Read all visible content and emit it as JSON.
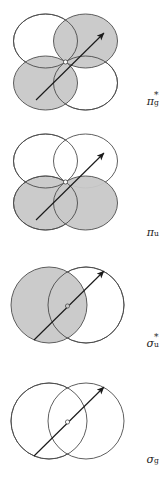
{
  "figure": {
    "background_color": "#ffffff",
    "stroke_color": "#4d4d4d",
    "shaded_fill": "#c8c8c8",
    "unshaded_fill": "#ffffff",
    "arrow_color": "#1a1a1a",
    "width_px": 163,
    "height_px": 480
  },
  "panels": [
    {
      "id": "pi-g-star",
      "label_base": "π",
      "label_sup": "*",
      "label_sub": "g",
      "label_plain": "π*g",
      "orbital_type": "pi",
      "lobe_count": 4,
      "shading": [
        "white",
        "shaded",
        "shaded",
        "white"
      ],
      "arrow": "diagonal-up-right"
    },
    {
      "id": "pi-u",
      "label_base": "π",
      "label_sup": "",
      "label_sub": "u",
      "label_plain": "πu",
      "orbital_type": "pi",
      "lobe_count": 4,
      "shading": [
        "white",
        "white",
        "shaded",
        "shaded"
      ],
      "arrow": "diagonal-up-right"
    },
    {
      "id": "sigma-u-star",
      "label_base": "σ",
      "label_sup": "*",
      "label_sub": "u",
      "label_plain": "σ*u",
      "orbital_type": "sigma",
      "lobe_count": 2,
      "shading": [
        "shaded",
        "white"
      ],
      "arrow": "diagonal-up-right"
    },
    {
      "id": "sigma-g",
      "label_base": "σ",
      "label_sup": "",
      "label_sub": "g",
      "label_plain": "σg",
      "orbital_type": "sigma",
      "lobe_count": 2,
      "shading": [
        "white",
        "white"
      ],
      "arrow": "diagonal-up-right"
    }
  ]
}
